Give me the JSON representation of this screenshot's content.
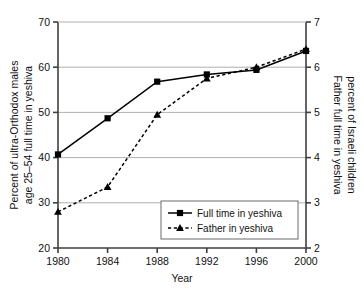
{
  "chart_data": {
    "type": "line",
    "title": "",
    "xlabel": "Year",
    "categories": [
      "1980",
      "1984",
      "1988",
      "1992",
      "1996",
      "2000"
    ],
    "x": [
      1980,
      1984,
      1988,
      1992,
      1996,
      2000
    ],
    "xlim": [
      1980,
      2000
    ],
    "grid": true,
    "grid_axis": "y",
    "legend_position": "lower right",
    "axes": [
      {
        "side": "left",
        "ylabel": "Percent of ultra-Orthodox males\nage 25–54 full time in yeshiva",
        "ylabel_line1": "Percent of ultra-Orthodox males",
        "ylabel_line2": "age 25–54 full time in yeshiva",
        "ylim": [
          20,
          70
        ],
        "ticks": [
          20,
          30,
          40,
          50,
          60,
          70
        ],
        "tick_labels": [
          "20",
          "30",
          "40",
          "50",
          "60",
          "70"
        ]
      },
      {
        "side": "right",
        "ylabel": "Father full time in yeshiva\npercent of Israeli children",
        "ylabel_line1": "Father full time in yeshiva",
        "ylabel_line2": "percent of Israeli children",
        "ylim": [
          2,
          7
        ],
        "ticks": [
          2,
          3,
          4,
          5,
          6,
          7
        ],
        "tick_labels": [
          "2",
          "3",
          "4",
          "5",
          "6",
          "7"
        ]
      }
    ],
    "series": [
      {
        "name": "Full time in yeshiva",
        "axis": "left",
        "marker": "square",
        "linestyle": "solid",
        "color": "#000000",
        "values": [
          40.7,
          48.7,
          56.8,
          58.4,
          59.4,
          63.6
        ]
      },
      {
        "name": "Father in yeshiva",
        "axis": "right",
        "marker": "triangle",
        "linestyle": "dashed",
        "color": "#000000",
        "values": [
          2.8,
          3.35,
          4.95,
          5.75,
          6.0,
          6.4
        ]
      }
    ]
  },
  "legend": {
    "items": [
      {
        "label": "Full time in yeshiva",
        "marker": "square",
        "linestyle": "solid"
      },
      {
        "label": "Father in yeshiva",
        "marker": "triangle",
        "linestyle": "dashed"
      }
    ]
  },
  "colors": {
    "axis": "#3f3f3f",
    "grid": "#b0b0b0",
    "series": "#000000",
    "background": "#ffffff"
  }
}
